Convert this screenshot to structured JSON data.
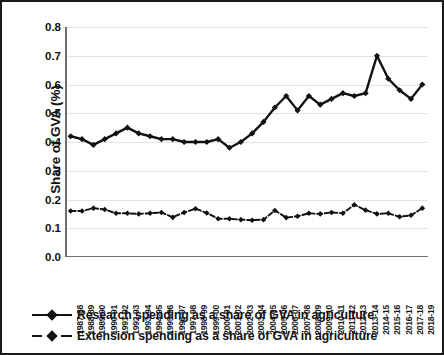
{
  "axes": {
    "y_title": "Share of GVA (%)",
    "y_ticks": [
      "0.0",
      "0.1",
      "0.2",
      "0.3",
      "0.4",
      "0.5",
      "0.6",
      "0.7",
      "0.8"
    ]
  },
  "legend": {
    "items": [
      {
        "label": "Research spending as a share of GVA in agriculture",
        "style": "solid",
        "color": "#111111"
      },
      {
        "label": "Extension spending as a share of GVA in agriculture",
        "style": "dashed",
        "color": "#111111"
      }
    ]
  },
  "chart_data": {
    "type": "line",
    "title": "",
    "subtitle": "",
    "xlabel": "",
    "ylabel": "Share of GVA (%)",
    "ylim": [
      0.0,
      0.8
    ],
    "ytick_step": 0.1,
    "grid": true,
    "legend_position": "bottom",
    "marker": "diamond",
    "categories": [
      "1987-88",
      "1988-89",
      "1989-90",
      "1990-91",
      "1991-92",
      "1992-93",
      "1993-94",
      "1994-95",
      "1995-96",
      "1996-97",
      "1997-98",
      "1998-99",
      "1999-00",
      "2000-01",
      "2001-02",
      "2002-03",
      "2003-04",
      "2004-05",
      "2005-06",
      "2006-07",
      "2007-08",
      "2008-09",
      "2009-10",
      "2010-11",
      "2011-12",
      "2012-13",
      "2013-14",
      "2014-15",
      "2015-16",
      "2016-17",
      "2017-18",
      "2018-19"
    ],
    "series": [
      {
        "name": "Research spending as a share of GVA in agriculture",
        "style": "solid",
        "color": "#111111",
        "values": [
          0.42,
          0.41,
          0.39,
          0.41,
          0.43,
          0.45,
          0.43,
          0.42,
          0.41,
          0.41,
          0.4,
          0.4,
          0.4,
          0.41,
          0.38,
          0.4,
          0.43,
          0.47,
          0.52,
          0.56,
          0.51,
          0.56,
          0.53,
          0.55,
          0.57,
          0.56,
          0.57,
          0.7,
          0.62,
          0.58,
          0.55,
          0.6
        ]
      },
      {
        "name": "Extension spending as a share of GVA in agriculture",
        "style": "dashed",
        "color": "#111111",
        "values": [
          0.16,
          0.16,
          0.17,
          0.165,
          0.152,
          0.152,
          0.15,
          0.152,
          0.155,
          0.138,
          0.155,
          0.168,
          0.153,
          0.133,
          0.133,
          0.13,
          0.128,
          0.13,
          0.162,
          0.137,
          0.142,
          0.152,
          0.15,
          0.155,
          0.152,
          0.182,
          0.163,
          0.15,
          0.152,
          0.14,
          0.145,
          0.17
        ]
      }
    ]
  }
}
